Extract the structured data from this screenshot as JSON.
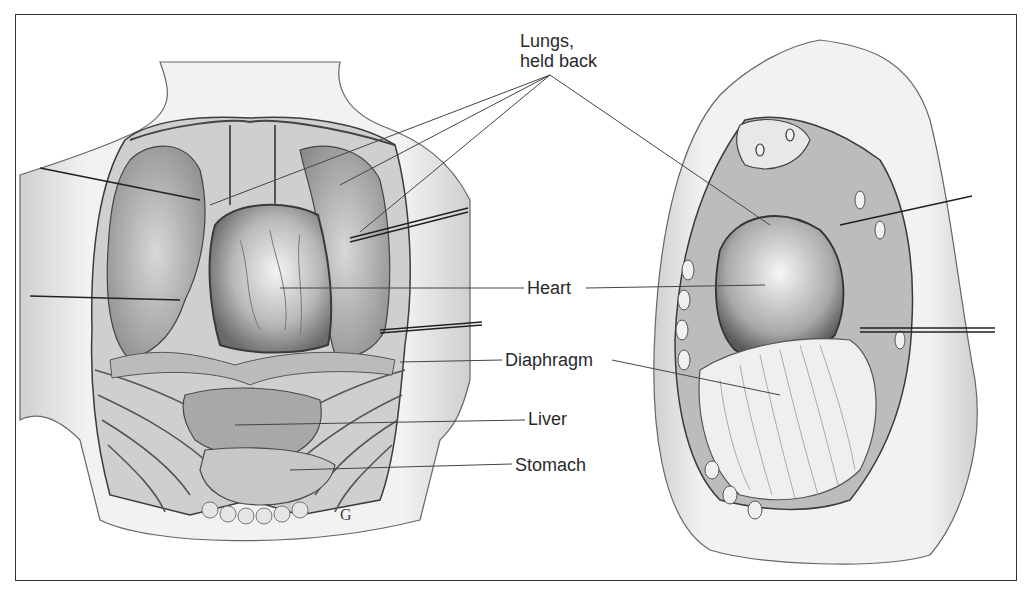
{
  "figure": {
    "type": "anatomical-illustration",
    "panels": [
      {
        "id": "front-view",
        "description": "Opened chest, front view"
      },
      {
        "id": "side-view",
        "description": "Opened chest, side view"
      }
    ]
  },
  "labels": {
    "lungs_line1": "Lungs,",
    "lungs_line2": "held back",
    "heart": "Heart",
    "diaphragm": "Diaphragm",
    "liver": "Liver",
    "stomach": "Stomach"
  },
  "signature": "G",
  "colors": {
    "ink": "#2a2a2a",
    "border": "#333333",
    "shade_light": "#e6e6e6",
    "shade_mid": "#bdbdbd",
    "shade_dark": "#6e6e6e",
    "background": "#ffffff"
  }
}
